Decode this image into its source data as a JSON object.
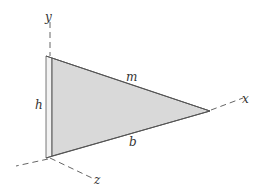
{
  "diagram": {
    "type": "3d-thin-triangular-plate",
    "axes": {
      "x": {
        "label": "x"
      },
      "y": {
        "label": "y"
      },
      "z": {
        "label": "z"
      }
    },
    "dimensions": {
      "height": {
        "label": "h"
      },
      "base": {
        "label": "b"
      },
      "mass": {
        "label": "m"
      }
    },
    "colors": {
      "plate_face": "#d9d9d9",
      "plate_edge": "#f2f2f2",
      "outline": "#555555",
      "axis": "#666666"
    }
  }
}
